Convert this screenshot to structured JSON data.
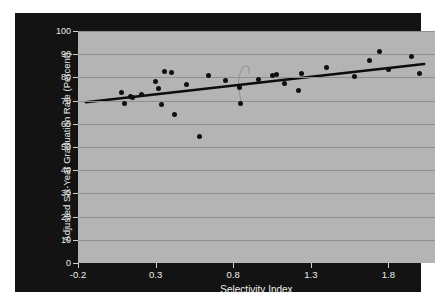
{
  "chart_data": {
    "type": "scatter",
    "title": "",
    "xlabel": "Selectivity Index",
    "ylabel": "Adjusted Six-Year Graduation Rate (Percent)",
    "xlim": [
      -0.2,
      2.1
    ],
    "ylim": [
      0,
      100
    ],
    "xticks": [
      "-0.2",
      "0.3",
      "0.8",
      "1.3",
      "1.8"
    ],
    "xtick_values": [
      -0.2,
      0.3,
      0.8,
      1.3,
      1.8
    ],
    "yticks": [
      "0",
      "10",
      "20",
      "30",
      "40",
      "50",
      "60",
      "70",
      "80",
      "90",
      "100"
    ],
    "ytick_values": [
      0,
      10,
      20,
      30,
      40,
      50,
      60,
      70,
      80,
      90,
      100
    ],
    "grid": "horizontal",
    "legend": "none",
    "marker_color": "#101010",
    "plot_background": "#b4b4b4",
    "panel_background": "#131313",
    "gridline_color": "#8f8f8f",
    "trendline_color": "#0d0d0d",
    "points": [
      {
        "x": 0.08,
        "y": 73.4
      },
      {
        "x": 0.1,
        "y": 68.6
      },
      {
        "x": 0.14,
        "y": 71.8
      },
      {
        "x": 0.15,
        "y": 71.2
      },
      {
        "x": 0.21,
        "y": 72.5
      },
      {
        "x": 0.3,
        "y": 78.2
      },
      {
        "x": 0.32,
        "y": 75.1
      },
      {
        "x": 0.34,
        "y": 68.4
      },
      {
        "x": 0.36,
        "y": 82.5
      },
      {
        "x": 0.4,
        "y": 81.9
      },
      {
        "x": 0.42,
        "y": 63.9
      },
      {
        "x": 0.5,
        "y": 76.8
      },
      {
        "x": 0.58,
        "y": 54.5
      },
      {
        "x": 0.64,
        "y": 80.8
      },
      {
        "x": 0.75,
        "y": 78.7
      },
      {
        "x": 0.84,
        "y": 75.7
      },
      {
        "x": 0.85,
        "y": 68.7
      },
      {
        "x": 0.96,
        "y": 79.3
      },
      {
        "x": 1.05,
        "y": 80.9
      },
      {
        "x": 1.08,
        "y": 81.2
      },
      {
        "x": 1.13,
        "y": 77.3
      },
      {
        "x": 1.22,
        "y": 74.2
      },
      {
        "x": 1.24,
        "y": 81.5
      },
      {
        "x": 1.4,
        "y": 84.3
      },
      {
        "x": 1.58,
        "y": 80.2
      },
      {
        "x": 1.68,
        "y": 87.5
      },
      {
        "x": 1.74,
        "y": 91.2
      },
      {
        "x": 1.8,
        "y": 83.3
      },
      {
        "x": 1.95,
        "y": 88.8
      },
      {
        "x": 2.0,
        "y": 81.8
      }
    ],
    "trendline": {
      "x0": -0.15,
      "y0": 69.3,
      "x1": 2.03,
      "y1": 85.8,
      "description": "linear fit line"
    },
    "artifact": {
      "description": "faint hand-drawn curved mark near x=0.85",
      "color": "#8a8a8a"
    }
  }
}
